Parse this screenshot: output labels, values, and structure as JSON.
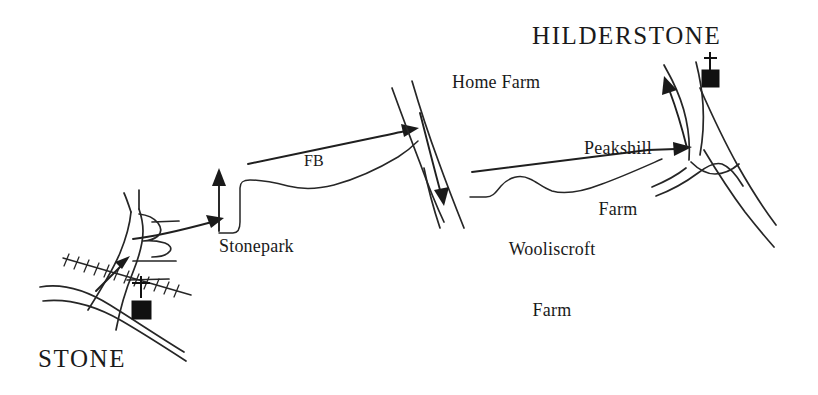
{
  "map": {
    "title": "Sketch map of walking route from Stone to Hilderstone",
    "background_color": "#ffffff",
    "ink_color": "#262626",
    "width": 818,
    "height": 395
  },
  "labels": {
    "stone": "STONE",
    "hilderstone": "HILDERSTONE",
    "stonepark": "Stonepark",
    "fb": "FB",
    "home_farm": "Home Farm",
    "peakshill_farm_line1": "Peakshill",
    "peakshill_farm_line2": "Farm",
    "wooliscroft_farm_line1": "Wooliscroft",
    "wooliscroft_farm_line2": "Farm"
  },
  "symbols": [
    {
      "name": "church-symbol-stone",
      "place": "Stone",
      "kind": "church-with-tower"
    },
    {
      "name": "church-symbol-hilderstone",
      "place": "Hilderstone",
      "kind": "church-with-spire"
    }
  ],
  "route_arrows": [
    {
      "name": "arrow-stone-northeast",
      "direction": "north-east"
    },
    {
      "name": "arrow-stonepark-north",
      "direction": "north"
    },
    {
      "name": "arrow-fb-east",
      "direction": "east"
    },
    {
      "name": "arrow-home-farm-east",
      "direction": "east"
    },
    {
      "name": "arrow-home-farm-south",
      "direction": "south"
    },
    {
      "name": "arrow-wooliscroft-east",
      "direction": "east"
    },
    {
      "name": "arrow-hilderstone-north",
      "direction": "north"
    }
  ]
}
